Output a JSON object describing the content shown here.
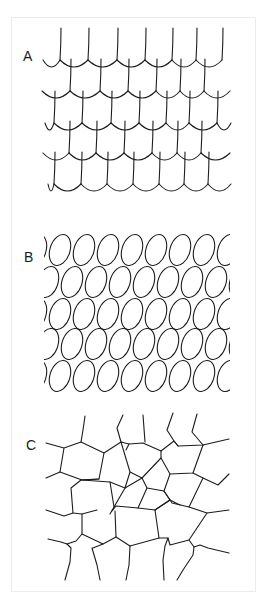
{
  "figure": {
    "panels": [
      {
        "id": "A",
        "label": "A",
        "description": "imbricate overlapping scales pattern"
      },
      {
        "id": "B",
        "label": "B",
        "description": "oval ring pattern"
      },
      {
        "id": "C",
        "label": "C",
        "description": "polygonal mosaic pattern"
      }
    ],
    "stroke_color": "#1c1c1c",
    "background_color": "#ffffff",
    "frame_color": "#ececec"
  }
}
